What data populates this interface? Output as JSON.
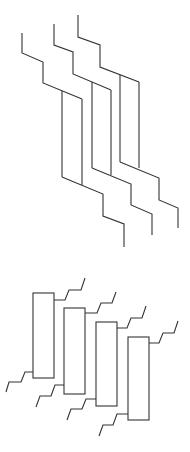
{
  "diagram": {
    "type": "line-drawing",
    "stroke_color": "#333333",
    "background": "#ffffff",
    "figures": [
      {
        "name": "upper-staggered-lead-paths",
        "description": "Three parallel stepped conductor paths, each splitting into two vertical lines and rejoining",
        "paths": [
          {
            "id": "path-1",
            "top": "M22,33 L22,53 L43,62 L43,83 L82,99",
            "branch_left": "M62,91 L62,177",
            "branch_right": "M82,99 L82,185",
            "bottom": "M62,177 L103,194 L103,216 L124,224 L124,247"
          },
          {
            "id": "path-2",
            "top": "M54,24 L54,45 L73,52 L73,74 L111,90",
            "branch_left": "M92,82 L92,168",
            "branch_right": "M111,90 L111,175",
            "bottom": "M92,168 L131,184 L131,205 L152,214 L152,235"
          },
          {
            "id": "path-3",
            "top": "M78,15 L78,37 L100,45 L100,67 L139,82",
            "branch_left": "M120,75 L120,162",
            "branch_right": "M139,82 L139,168",
            "bottom": "M120,162 L159,178 L159,200 L178,208 L178,228"
          }
        ]
      },
      {
        "name": "lower-rectangle-components",
        "description": "Four staggered rectangular components each with a stepped lead at top-right and bottom-left",
        "components": [
          {
            "id": "component-1",
            "rect": {
              "x": 33,
              "y": 293,
              "w": 21,
              "h": 85
            },
            "lead_top": "M54,300 L65,300 L69,290 L81,290 L85,278",
            "lead_bottom": "M33,372 L25,372 L21,382 L9,382 L6,392"
          },
          {
            "id": "component-2",
            "rect": {
              "x": 64,
              "y": 308,
              "w": 21,
              "h": 86
            },
            "lead_top": "M85,313 L97,313 L101,303 L112,303 L116,292",
            "lead_bottom": "M64,385 L55,385 L51,396 L40,396 L36,407"
          },
          {
            "id": "component-3",
            "rect": {
              "x": 96,
              "y": 322,
              "w": 21,
              "h": 84
            },
            "lead_top": "M117,328 L127,328 L131,318 L142,318 L146,306",
            "lead_bottom": "M96,399 L86,399 L82,409 L71,409 L67,420"
          },
          {
            "id": "component-4",
            "rect": {
              "x": 128,
              "y": 337,
              "w": 21,
              "h": 83
            },
            "lead_top": "M149,343 L159,343 L163,333 L174,333 L178,321",
            "lead_bottom": "M128,414 L117,414 L113,425 L103,425 L99,436"
          }
        ]
      }
    ]
  }
}
